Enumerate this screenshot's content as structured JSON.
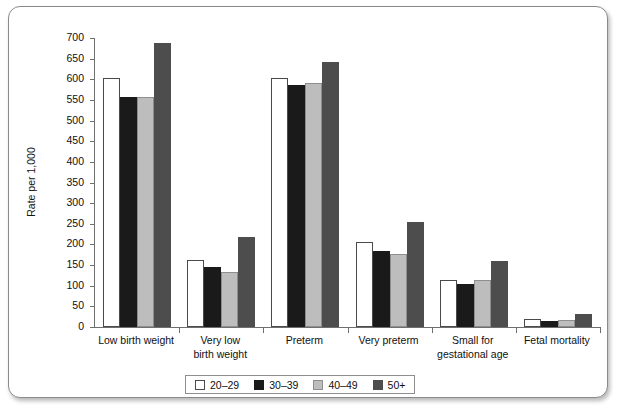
{
  "chart_data": {
    "type": "bar",
    "title": "",
    "xlabel": "",
    "ylabel": "Rate per 1,000",
    "ylim": [
      0,
      700
    ],
    "ytick_step": 50,
    "yticks": [
      700,
      650,
      600,
      550,
      500,
      450,
      400,
      350,
      300,
      250,
      200,
      150,
      100,
      50,
      0
    ],
    "grid": false,
    "legend_position": "bottom-center",
    "categories": [
      "Low birth weight",
      "Very low birth weight",
      "Preterm",
      "Very preterm",
      "Small for gestational age",
      "Fetal mortality"
    ],
    "category_lines": [
      [
        "Low birth weight"
      ],
      [
        "Very low",
        "birth weight"
      ],
      [
        "Preterm"
      ],
      [
        "Very preterm"
      ],
      [
        "Small for",
        "gestational age"
      ],
      [
        "Fetal mortality"
      ]
    ],
    "series": [
      {
        "name": "20–29",
        "color": "#ffffff",
        "values": [
          603,
          163,
          603,
          207,
          115,
          20
        ]
      },
      {
        "name": "30–39",
        "color": "#1a1a1a",
        "values": [
          556,
          146,
          585,
          185,
          103,
          15
        ]
      },
      {
        "name": "40–49",
        "color": "#bdbdbd",
        "values": [
          558,
          133,
          592,
          178,
          113,
          17
        ]
      },
      {
        "name": "50+",
        "color": "#4d4d4d",
        "values": [
          689,
          218,
          643,
          255,
          160,
          32
        ]
      }
    ]
  },
  "legend": {
    "items": [
      {
        "label": "20–29",
        "swatch": "white-swatch"
      },
      {
        "label": "30–39",
        "swatch": "black-swatch"
      },
      {
        "label": "40–49",
        "swatch": "light-gray-swatch"
      },
      {
        "label": "50+",
        "swatch": "dark-gray-swatch"
      }
    ]
  }
}
